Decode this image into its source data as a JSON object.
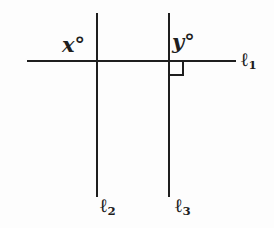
{
  "diagram": {
    "type": "geometry-figure",
    "description_visible_elements": "one horizontal transversal line crossed by two vertical parallel lines with a right-angle marker at the second intersection",
    "angle_labels": {
      "x": "x°",
      "y": "y°"
    },
    "line_labels": [
      {
        "symbol": "ℓ",
        "sub": "1"
      },
      {
        "symbol": "ℓ",
        "sub": "2"
      },
      {
        "symbol": "ℓ",
        "sub": "3"
      }
    ],
    "right_angle_marker": "small square at intersection of ℓ1 and ℓ3",
    "colors": {
      "line": "#1e1e1e",
      "background": "#fdfdfd"
    }
  }
}
